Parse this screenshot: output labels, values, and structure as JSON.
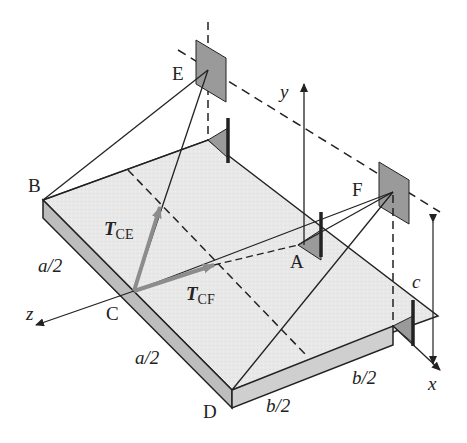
{
  "figure": {
    "points": {
      "A": "A",
      "B": "B",
      "C": "C",
      "D": "D",
      "E": "E",
      "F": "F"
    },
    "axes": {
      "x": "x",
      "y": "y",
      "z": "z"
    },
    "dimensions": {
      "a_half_upper": "a/2",
      "a_half_lower": "a/2",
      "b_half_left": "b/2",
      "b_half_right": "b/2",
      "c": "c"
    },
    "forces": {
      "T_CE": {
        "symbol": "T",
        "subscript": "CE"
      },
      "T_CF": {
        "symbol": "T",
        "subscript": "CF"
      }
    },
    "colors": {
      "plate_top": "#e6e6e6",
      "plate_edge": "#bdbdbd",
      "bracket": "#9a9a9a",
      "force_vector": "#8c8c8c",
      "line": "#222222"
    }
  }
}
